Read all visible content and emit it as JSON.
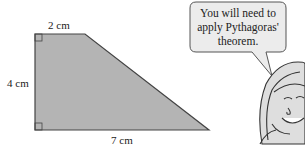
{
  "diagram": {
    "shape": "trapezium",
    "labels": {
      "top": "2 cm",
      "left": "4 cm",
      "bottom": "7 cm"
    },
    "fill_color": "#b4b4b4",
    "stroke_color": "#444444",
    "right_angles": [
      "top-left",
      "bottom-left"
    ]
  },
  "speech_bubble": {
    "lines": [
      "You will need to",
      "apply Pythagoras'",
      "theorem."
    ]
  }
}
